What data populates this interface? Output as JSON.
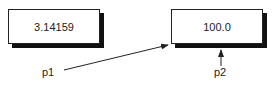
{
  "boxes": [
    {
      "value": "3.14159"
    },
    {
      "value": "100.0"
    }
  ],
  "pointers": [
    {
      "label": "p1"
    },
    {
      "label": "p2"
    }
  ]
}
